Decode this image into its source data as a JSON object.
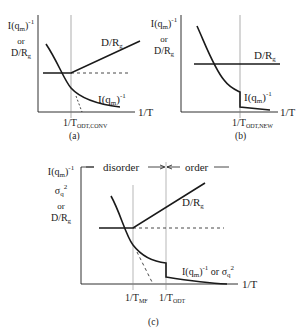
{
  "panels": {
    "a": {
      "caption": "(a)",
      "ylabel": {
        "line1": "I(q",
        "line1_sub": "m",
        "line1_close": ")",
        "line1_sup": "-1",
        "line2": "or",
        "line3": "D/R",
        "line3_sub": "g"
      },
      "xlabel": "1/T",
      "transition_label": "1/T",
      "transition_sub": "ODT,CONV",
      "curve_label_upper": {
        "text": "D/R",
        "sub": "g"
      },
      "curve_label_lower": {
        "text": "I(q",
        "sub": "m",
        "close": ")",
        "sup": "-1"
      }
    },
    "b": {
      "caption": "(b)",
      "ylabel": {
        "line1": "I(q",
        "line1_sub": "m",
        "line1_close": ")",
        "line1_sup": "-1",
        "line2": "or",
        "line3": "D/R",
        "line3_sub": "g"
      },
      "xlabel": "1/T",
      "transition_label": "1/T",
      "transition_sub": "ODT,NEW",
      "curve_label_upper": {
        "text": "D/R",
        "sub": "g"
      },
      "curve_label_lower": {
        "text": "I(q",
        "sub": "m",
        "close": ")",
        "sup": "-1"
      }
    },
    "c": {
      "caption": "(c)",
      "ylabel": {
        "line1": "I(q",
        "line1_sub": "m",
        "line1_close": ")",
        "line1_sup": "-1",
        "line2": "σ",
        "line2_sub": "q",
        "line2_sup": "2",
        "line3": "or",
        "line4": "D/R",
        "line4_sub": "g"
      },
      "xlabel": "1/T",
      "region_left": "disorder",
      "region_right": "order",
      "mf_label": "1/T",
      "mf_sub": "MF",
      "odt_label": "1/T",
      "odt_sub": "ODT",
      "curve_label_upper": {
        "text": "D/R",
        "sub": "g"
      },
      "curve_label_lower": {
        "text": "I(q",
        "sub": "m",
        "close": ")",
        "sup": "-1",
        "or": " or σ",
        "sub2": "q",
        "sup2": "2"
      }
    }
  },
  "colors": {
    "line": "#1a1a1a",
    "axis": "#333333",
    "guide": "#888888",
    "background": "#ffffff"
  }
}
